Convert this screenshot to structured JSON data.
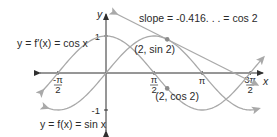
{
  "chart_data": {
    "type": "line",
    "title": "",
    "xlabel": "x",
    "ylabel": "y",
    "xlim": [
      -2.0,
      5.2
    ],
    "ylim": [
      -1.0,
      1.0
    ],
    "grid": false,
    "x_ticks": [
      {
        "value": -1.5708,
        "num": "-π",
        "den": "2"
      },
      {
        "value": 1.5708,
        "num": "π",
        "den": "2"
      },
      {
        "value": 3.1416,
        "label": "π"
      },
      {
        "value": 4.7124,
        "num": "3π",
        "den": "2"
      }
    ],
    "y_ticks": [
      {
        "value": 1,
        "label": "1"
      },
      {
        "value": -1,
        "label": "-1"
      }
    ],
    "series": [
      {
        "name": "y = f(x) = sin x",
        "function": "sin",
        "domain": [
          -1.9,
          5.0
        ]
      },
      {
        "name": "y = f′(x) = cos x",
        "function": "cos",
        "domain": [
          -2.05,
          5.15
        ]
      }
    ],
    "tangent_line": {
      "point": [
        2,
        0.909
      ],
      "slope": -0.416,
      "domain": [
        0.35,
        4.95
      ]
    },
    "points": [
      {
        "x": 2,
        "y": 0.909,
        "label": "(2, sin 2)"
      },
      {
        "x": 2,
        "y": -0.416,
        "label": "(2, cos 2)"
      }
    ],
    "annotations": {
      "slope": "slope = -0.416. . . = cos 2",
      "cos_label": "y = f′(x) = cos x",
      "sin_label": "y = f(x) = sin x"
    },
    "colors": {
      "curve": "#a9a9a9",
      "axis": "#2f2f2f",
      "text": "#2a2a2a"
    }
  }
}
